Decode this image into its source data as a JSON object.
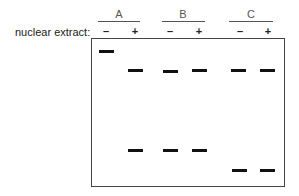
{
  "figure": {
    "row_label": "nuclear extract:",
    "groups": [
      {
        "label": "A",
        "line_x": 98,
        "line_w": 42
      },
      {
        "label": "B",
        "line_x": 162,
        "line_w": 43
      },
      {
        "label": "C",
        "line_x": 229,
        "line_w": 44
      }
    ],
    "lanes": [
      {
        "group": "A",
        "sign": "–",
        "x": 106
      },
      {
        "group": "A",
        "sign": "+",
        "x": 135
      },
      {
        "group": "B",
        "sign": "–",
        "x": 170
      },
      {
        "group": "B",
        "sign": "+",
        "x": 199
      },
      {
        "group": "C",
        "sign": "–",
        "x": 240
      },
      {
        "group": "C",
        "sign": "+",
        "x": 268
      }
    ],
    "bands": [
      {
        "lane": 0,
        "y": 50
      },
      {
        "lane": 1,
        "y": 69
      },
      {
        "lane": 2,
        "y": 70
      },
      {
        "lane": 3,
        "y": 69
      },
      {
        "lane": 4,
        "y": 69
      },
      {
        "lane": 5,
        "y": 69
      },
      {
        "lane": 1,
        "y": 149
      },
      {
        "lane": 2,
        "y": 149
      },
      {
        "lane": 3,
        "y": 149
      },
      {
        "lane": 4,
        "y": 169
      },
      {
        "lane": 5,
        "y": 169
      }
    ]
  }
}
